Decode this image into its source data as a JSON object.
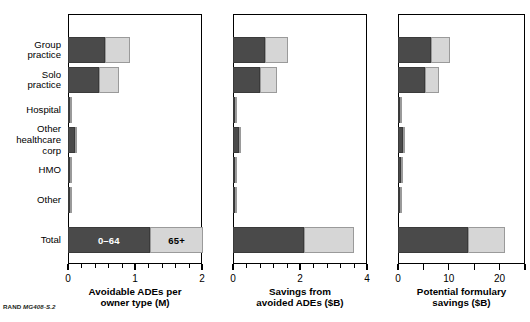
{
  "figure": {
    "source_note_prefix": "RAND",
    "source_note_id": "MG408-S.2"
  },
  "categories": [
    "Group\npractice",
    "Solo\npractice",
    "Hospital",
    "Other\nhealthcare\ncorp",
    "HMO",
    "Other",
    "Total"
  ],
  "legend": {
    "dark_label": "0–64",
    "light_label": "65+"
  },
  "colors": {
    "dark": "#4a4a4a",
    "light": "#d6d6d6",
    "axis": "#000000",
    "background": "#ffffff"
  },
  "chart_data": [
    {
      "type": "bar",
      "orientation": "horizontal",
      "stacked": true,
      "title": "",
      "xlabel": "Avoidable ADEs per owner type (M)",
      "ylabel": "",
      "xlim": [
        0,
        2
      ],
      "major_ticks": [
        0,
        1,
        2
      ],
      "tick_labels": [
        "0",
        "1",
        "2"
      ],
      "minor_tick_step": 0.2,
      "grid": false,
      "categories": [
        "Group practice",
        "Solo practice",
        "Hospital",
        "Other healthcare corp",
        "HMO",
        "Other",
        "Total"
      ],
      "series": [
        {
          "name": "0–64",
          "values": [
            0.55,
            0.46,
            0.02,
            0.1,
            0.03,
            0.03,
            1.22
          ]
        },
        {
          "name": "65+",
          "values": [
            0.37,
            0.3,
            0.005,
            0.03,
            0.01,
            0.01,
            0.8
          ]
        }
      ],
      "bar_labels": {
        "Total": {
          "0–64": "0–64",
          "65+": "65+"
        }
      }
    },
    {
      "type": "bar",
      "orientation": "horizontal",
      "stacked": true,
      "title": "",
      "xlabel": "Savings from avoided ADEs ($B)",
      "ylabel": "",
      "xlim": [
        0,
        4
      ],
      "major_ticks": [
        0,
        2,
        4
      ],
      "tick_labels": [
        "0",
        "2",
        "4"
      ],
      "minor_tick_step": 0.4,
      "grid": false,
      "categories": [
        "Group practice",
        "Solo practice",
        "Hospital",
        "Other healthcare corp",
        "HMO",
        "Other",
        "Total"
      ],
      "series": [
        {
          "name": "0–64",
          "values": [
            0.95,
            0.82,
            0.04,
            0.18,
            0.06,
            0.04,
            2.12
          ]
        },
        {
          "name": "65+",
          "values": [
            0.68,
            0.5,
            0.01,
            0.06,
            0.02,
            0.01,
            1.48
          ]
        }
      ]
    },
    {
      "type": "bar",
      "orientation": "horizontal",
      "stacked": true,
      "title": "",
      "xlabel": "Potential formulary savings ($B)",
      "ylabel": "",
      "xlim": [
        0,
        25
      ],
      "major_ticks": [
        0,
        5,
        10,
        15,
        20,
        25
      ],
      "tick_labels": [
        "0",
        "",
        "10",
        "",
        "20",
        ""
      ],
      "minor_tick_step": 5,
      "grid": false,
      "categories": [
        "Group practice",
        "Solo practice",
        "Hospital",
        "Other healthcare corp",
        "HMO",
        "Other",
        "Total"
      ],
      "series": [
        {
          "name": "0–64",
          "values": [
            6.4,
            5.3,
            0.3,
            0.9,
            0.5,
            0.4,
            13.8
          ]
        },
        {
          "name": "65+",
          "values": [
            3.9,
            2.7,
            0.1,
            0.3,
            0.15,
            0.1,
            7.2
          ]
        }
      ]
    }
  ],
  "panels": [
    {
      "axis_title_line1": "Avoidable ADEs per",
      "axis_title_line2": "owner type (M)"
    },
    {
      "axis_title_line1": "Savings from",
      "axis_title_line2": "avoided ADEs ($B)"
    },
    {
      "axis_title_line1": "Potential formulary",
      "axis_title_line2": "savings ($B)"
    }
  ]
}
